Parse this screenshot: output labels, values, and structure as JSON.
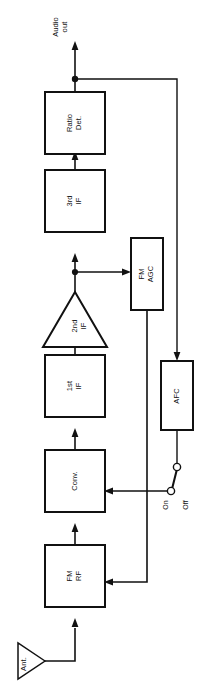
{
  "diagram": {
    "orientation": "rotated-90-ccw",
    "signal_flow": "Ant. -> FM RF -> Conv. -> 1st IF -> 2nd IF -> 3rd IF -> Ratio Det. -> Audio out",
    "blocks": [
      {
        "id": "ant",
        "label": "Ant.",
        "shape": "antenna-triangle"
      },
      {
        "id": "fm_rf",
        "label": "FM\nRF",
        "shape": "rectangle"
      },
      {
        "id": "conv",
        "label": "Conv.",
        "shape": "rectangle"
      },
      {
        "id": "if1",
        "label": "1st\nIF",
        "shape": "rectangle"
      },
      {
        "id": "if2",
        "label": "2nd\nIF",
        "shape": "triangle-amplifier"
      },
      {
        "id": "if3",
        "label": "3rd\nIF",
        "shape": "rectangle"
      },
      {
        "id": "ratio_det",
        "label": "Ratio\nDet.",
        "shape": "rectangle"
      },
      {
        "id": "fm_agc",
        "label": "FM\nAGC",
        "shape": "rectangle"
      },
      {
        "id": "afc",
        "label": "AFC",
        "shape": "rectangle"
      }
    ],
    "terminals": [
      {
        "id": "audio_out",
        "label": "Audio\nout"
      }
    ],
    "switch": {
      "id": "afc_switch",
      "on_label": "On",
      "off_label": "Off",
      "position": "On"
    },
    "colors": {
      "line": "#111111",
      "background": "#ffffff",
      "block_fill": "#ffffff"
    }
  }
}
